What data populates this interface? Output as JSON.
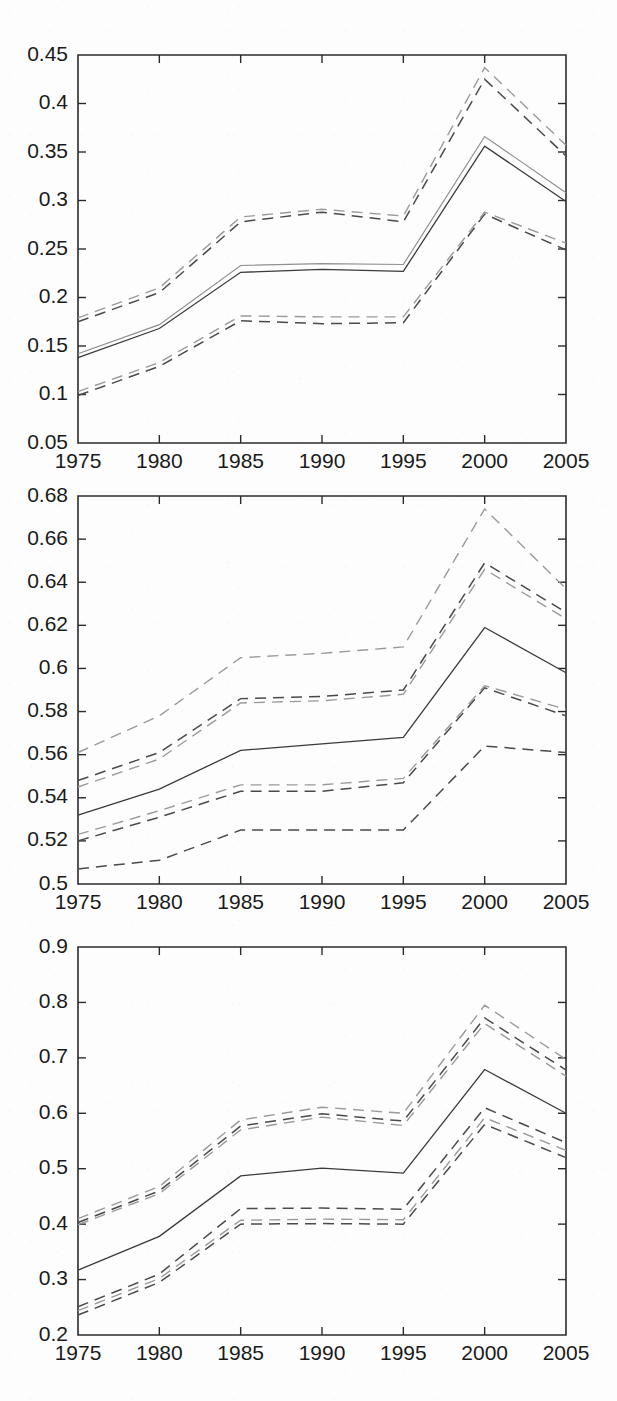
{
  "figure": {
    "kind": "multi-panel-line-chart",
    "panel_count": 3,
    "background_color": "#fdfdfd",
    "axis_color": "#2b2b2b",
    "solid_color": "#3a3a3a",
    "dashed_color": "#4a4a4a"
  },
  "chart_data": [
    {
      "type": "line",
      "panel": 1,
      "title": "",
      "xlabel": "",
      "ylabel": "",
      "x": [
        1975,
        1980,
        1985,
        1990,
        1995,
        2000,
        2005
      ],
      "xlim": [
        1975,
        2005
      ],
      "ylim": [
        0.05,
        0.45
      ],
      "xticks": [
        1975,
        1980,
        1985,
        1990,
        1995,
        2000,
        2005
      ],
      "xtick_labels": [
        "1975",
        "1980",
        "1985",
        "1990",
        "1995",
        "2000",
        "2005"
      ],
      "yticks": [
        0.05,
        0.1,
        0.15,
        0.2,
        0.25,
        0.3,
        0.35,
        0.4,
        0.45
      ],
      "ytick_labels": [
        "0.05",
        "0.1",
        "0.15",
        "0.2",
        "0.25",
        "0.3",
        "0.35",
        "0.4",
        "0.45"
      ],
      "grid": false,
      "legend": "none",
      "series": [
        {
          "name": "estimate-a",
          "style": "solid",
          "values": [
            0.138,
            0.168,
            0.226,
            0.229,
            0.227,
            0.356,
            0.299
          ]
        },
        {
          "name": "estimate-b",
          "style": "solid",
          "values": [
            0.142,
            0.172,
            0.233,
            0.235,
            0.234,
            0.366,
            0.308
          ]
        },
        {
          "name": "upper-ci-a",
          "style": "dashed",
          "values": [
            0.175,
            0.205,
            0.278,
            0.288,
            0.278,
            0.425,
            0.346
          ]
        },
        {
          "name": "upper-ci-b",
          "style": "dashed",
          "values": [
            0.179,
            0.21,
            0.283,
            0.291,
            0.284,
            0.437,
            0.357
          ]
        },
        {
          "name": "lower-ci-a",
          "style": "dashed",
          "values": [
            0.099,
            0.129,
            0.176,
            0.173,
            0.174,
            0.286,
            0.249
          ]
        },
        {
          "name": "lower-ci-b",
          "style": "dashed",
          "values": [
            0.103,
            0.133,
            0.181,
            0.18,
            0.18,
            0.288,
            0.256
          ]
        }
      ]
    },
    {
      "type": "line",
      "panel": 2,
      "title": "",
      "xlabel": "",
      "ylabel": "",
      "x": [
        1975,
        1980,
        1985,
        1990,
        1995,
        2000,
        2005
      ],
      "xlim": [
        1975,
        2005
      ],
      "ylim": [
        0.5,
        0.68
      ],
      "xticks": [
        1975,
        1980,
        1985,
        1990,
        1995,
        2000,
        2005
      ],
      "xtick_labels": [
        "1975",
        "1980",
        "1985",
        "1990",
        "1995",
        "2000",
        "2005"
      ],
      "yticks": [
        0.5,
        0.52,
        0.54,
        0.56,
        0.58,
        0.6,
        0.62,
        0.64,
        0.66,
        0.68
      ],
      "ytick_labels": [
        "0.5",
        "0.52",
        "0.54",
        "0.56",
        "0.58",
        "0.6",
        "0.62",
        "0.64",
        "0.66",
        "0.68"
      ],
      "grid": false,
      "legend": "none",
      "series": [
        {
          "name": "estimate-a",
          "style": "solid",
          "values": [
            0.532,
            0.544,
            0.562,
            0.565,
            0.568,
            0.619,
            0.598
          ]
        },
        {
          "name": "upper-ci-a",
          "style": "dashed",
          "values": [
            0.545,
            0.558,
            0.584,
            0.585,
            0.588,
            0.646,
            0.623
          ]
        },
        {
          "name": "upper-ci-b",
          "style": "dashed",
          "values": [
            0.548,
            0.561,
            0.586,
            0.587,
            0.59,
            0.649,
            0.626
          ]
        },
        {
          "name": "upper-ci-outer",
          "style": "dashed",
          "values": [
            0.561,
            0.578,
            0.605,
            0.607,
            0.61,
            0.674,
            0.637
          ]
        },
        {
          "name": "lower-ci-a",
          "style": "dashed",
          "values": [
            0.52,
            0.531,
            0.543,
            0.543,
            0.547,
            0.591,
            0.578
          ]
        },
        {
          "name": "lower-ci-b",
          "style": "dashed",
          "values": [
            0.523,
            0.534,
            0.546,
            0.546,
            0.549,
            0.592,
            0.581
          ]
        },
        {
          "name": "lower-ci-outer",
          "style": "dashed",
          "values": [
            0.507,
            0.511,
            0.525,
            0.525,
            0.525,
            0.564,
            0.561
          ]
        }
      ]
    },
    {
      "type": "line",
      "panel": 3,
      "title": "",
      "xlabel": "",
      "ylabel": "",
      "x": [
        1975,
        1980,
        1985,
        1990,
        1995,
        2000,
        2005
      ],
      "xlim": [
        1975,
        2005
      ],
      "ylim": [
        0.2,
        0.9
      ],
      "xticks": [
        1975,
        1980,
        1985,
        1990,
        1995,
        2000,
        2005
      ],
      "xtick_labels": [
        "1975",
        "1980",
        "1985",
        "1990",
        "1995",
        "2000",
        "2005"
      ],
      "yticks": [
        0.2,
        0.3,
        0.4,
        0.5,
        0.6,
        0.7,
        0.8,
        0.9
      ],
      "ytick_labels": [
        "0.2",
        "0.3",
        "0.4",
        "0.5",
        "0.6",
        "0.7",
        "0.8",
        "0.9"
      ],
      "grid": false,
      "legend": "none",
      "series": [
        {
          "name": "estimate-a",
          "style": "solid",
          "values": [
            0.317,
            0.378,
            0.487,
            0.501,
            0.492,
            0.679,
            0.6
          ]
        },
        {
          "name": "upper-ci-a",
          "style": "dashed",
          "values": [
            0.399,
            0.455,
            0.57,
            0.593,
            0.578,
            0.762,
            0.667
          ]
        },
        {
          "name": "upper-ci-b",
          "style": "dashed",
          "values": [
            0.403,
            0.46,
            0.577,
            0.599,
            0.586,
            0.772,
            0.678
          ]
        },
        {
          "name": "upper-ci-outer",
          "style": "dashed",
          "values": [
            0.41,
            0.468,
            0.588,
            0.611,
            0.6,
            0.795,
            0.697
          ]
        },
        {
          "name": "lower-ci-a",
          "style": "dashed",
          "values": [
            0.236,
            0.295,
            0.4,
            0.401,
            0.4,
            0.58,
            0.52
          ]
        },
        {
          "name": "lower-ci-b",
          "style": "dashed",
          "values": [
            0.244,
            0.302,
            0.407,
            0.409,
            0.408,
            0.592,
            0.533
          ]
        },
        {
          "name": "lower-ci-outer",
          "style": "dashed",
          "values": [
            0.251,
            0.31,
            0.428,
            0.429,
            0.427,
            0.61,
            0.547
          ]
        }
      ]
    }
  ]
}
